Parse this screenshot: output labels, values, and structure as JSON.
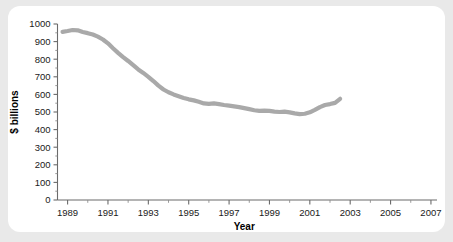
{
  "chart_data": {
    "type": "line",
    "title": "",
    "xlabel": "Year",
    "ylabel": "$ billions",
    "xlim": [
      1988.5,
      2007.3
    ],
    "ylim": [
      0,
      1000
    ],
    "grid": false,
    "legend": "none",
    "line_color": "#a9a9a9",
    "axis_color": "#6b6b6b",
    "text_color": "#1a1a1a",
    "background_color": "#e9e9e9",
    "card_color": "#ffffff",
    "x_tick_labels": [
      "1989",
      "1991",
      "1993",
      "1995",
      "1997",
      "1999",
      "2001",
      "2003",
      "2005",
      "2007"
    ],
    "x_tick_values": [
      1989,
      1991,
      1993,
      1995,
      1997,
      1999,
      2001,
      2003,
      2005,
      2007
    ],
    "x_minor_tick_values": [
      1990,
      1992,
      1994,
      1996,
      1998,
      2000,
      2002,
      2004,
      2006
    ],
    "y_tick_labels": [
      "0",
      "100",
      "200",
      "300",
      "400",
      "500",
      "600",
      "700",
      "800",
      "900",
      "1000"
    ],
    "y_tick_values": [
      0,
      100,
      200,
      300,
      400,
      500,
      600,
      700,
      800,
      900,
      1000
    ],
    "x": [
      1988.75,
      1989.0,
      1989.25,
      1989.5,
      1989.75,
      1990.0,
      1990.25,
      1990.5,
      1990.75,
      1991.0,
      1991.25,
      1991.5,
      1991.75,
      1992.0,
      1992.25,
      1992.5,
      1992.75,
      1993.0,
      1993.25,
      1993.5,
      1993.75,
      1994.0,
      1994.25,
      1994.5,
      1994.75,
      1995.0,
      1995.25,
      1995.5,
      1995.75,
      1996.0,
      1996.25,
      1996.5,
      1996.75,
      1997.0,
      1997.25,
      1997.5,
      1997.75,
      1998.0,
      1998.25,
      1998.5,
      1998.75,
      1999.0,
      1999.25,
      1999.5,
      1999.75,
      2000.0,
      2000.25,
      2000.5,
      2000.75,
      2001.0,
      2001.25,
      2001.5,
      2001.75,
      2002.0,
      2002.25,
      2002.5
    ],
    "y": [
      955,
      960,
      966,
      964,
      955,
      948,
      940,
      928,
      912,
      890,
      862,
      836,
      812,
      790,
      766,
      742,
      722,
      700,
      676,
      650,
      628,
      612,
      600,
      590,
      580,
      572,
      566,
      558,
      549,
      546,
      549,
      545,
      540,
      536,
      532,
      528,
      522,
      516,
      510,
      506,
      508,
      506,
      502,
      500,
      502,
      498,
      492,
      488,
      490,
      498,
      512,
      528,
      540,
      545,
      552,
      575
    ],
    "series": [
      {
        "name": "$ billions",
        "values": [
          955,
          960,
          966,
          964,
          955,
          948,
          940,
          928,
          912,
          890,
          862,
          836,
          812,
          790,
          766,
          742,
          722,
          700,
          676,
          650,
          628,
          612,
          600,
          590,
          580,
          572,
          566,
          558,
          549,
          546,
          549,
          545,
          540,
          536,
          532,
          528,
          522,
          516,
          510,
          506,
          508,
          506,
          502,
          500,
          502,
          498,
          492,
          488,
          490,
          498,
          512,
          528,
          540,
          545,
          552,
          575
        ]
      }
    ]
  }
}
